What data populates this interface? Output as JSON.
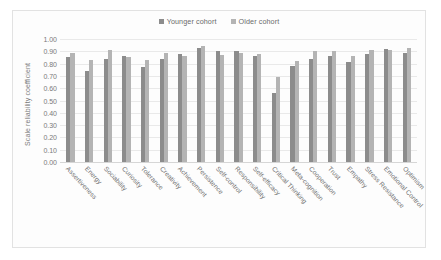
{
  "chart_data": {
    "type": "bar",
    "title": "",
    "xlabel": "",
    "ylabel": "Scale reliability coefficient",
    "ylim": [
      0.0,
      1.0
    ],
    "ytick_labels": [
      "1.00",
      "0.90",
      "0.80",
      "0.70",
      "0.60",
      "0.50",
      "0.40",
      "0.30",
      "0.20",
      "0.10",
      "0.00"
    ],
    "ytick_values": [
      1.0,
      0.9,
      0.8,
      0.7,
      0.6,
      0.5,
      0.4,
      0.3,
      0.2,
      0.1,
      0.0
    ],
    "grid": true,
    "legend_position": "top-center",
    "categories": [
      "Assertiveness",
      "Energy",
      "Sociability",
      "Curiosity",
      "Tolerance",
      "Creativity",
      "Achievement",
      "Persistence",
      "Self-control",
      "Responsibility",
      "Self-efficacy",
      "Critical Thinking",
      "Meta-cognition",
      "Cooperation",
      "Trust",
      "Empathy",
      "Stress Resistance",
      "Emotional Control",
      "Optimism"
    ],
    "series": [
      {
        "name": "Younger cohort",
        "color": "#8c8c8c",
        "values": [
          0.85,
          0.74,
          0.84,
          0.86,
          0.77,
          0.84,
          0.88,
          0.93,
          0.9,
          0.9,
          0.86,
          0.56,
          0.78,
          0.84,
          0.86,
          0.81,
          0.88,
          0.92,
          0.89
        ]
      },
      {
        "name": "Older cohort",
        "color": "#b4b4b4",
        "values": [
          0.89,
          0.83,
          0.91,
          0.85,
          0.83,
          0.89,
          0.86,
          0.94,
          0.87,
          0.89,
          0.88,
          0.69,
          0.82,
          0.9,
          0.9,
          0.86,
          0.91,
          0.91,
          0.93
        ]
      }
    ]
  },
  "legend": {
    "entries": [
      {
        "label": "Younger cohort",
        "color": "#8c8c8c"
      },
      {
        "label": "Older cohort",
        "color": "#b4b4b4"
      }
    ]
  }
}
